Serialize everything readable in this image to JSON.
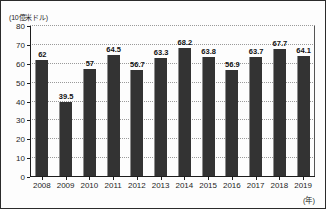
{
  "chart_data": {
    "type": "bar",
    "title": "",
    "xlabel": "(年)",
    "ylabel": "(10億米ドル)",
    "ylim": [
      0,
      80
    ],
    "yticks": [
      0,
      10,
      20,
      30,
      40,
      50,
      60,
      70,
      80
    ],
    "ytick_labels": [
      "0",
      "10",
      "20",
      "30",
      "40",
      "50",
      "60",
      "70",
      "80"
    ],
    "grid": true,
    "legend": "none",
    "categories": [
      "2008",
      "2009",
      "2010",
      "2011",
      "2012",
      "2013",
      "2014",
      "2015",
      "2016",
      "2017",
      "2018",
      "2019"
    ],
    "values": [
      62,
      39.5,
      57,
      64.5,
      56.7,
      63.3,
      68.2,
      63.8,
      56.9,
      63.7,
      67.7,
      64.1
    ],
    "value_labels": [
      "62",
      "39.5",
      "57",
      "64.5",
      "56.7",
      "63.3",
      "68.2",
      "63.8",
      "56.9",
      "63.7",
      "67.7",
      "64.1"
    ],
    "bar_color": "#333333",
    "grid_color": "#9a9a9a",
    "axis_color": "#1d1d1d",
    "background": "#fdfdfd"
  }
}
